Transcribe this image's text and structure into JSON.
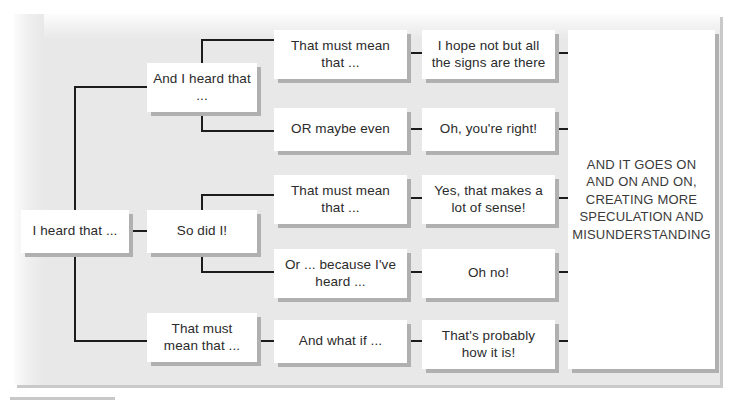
{
  "diagram": {
    "background_color": "#e8e8e8",
    "box_fill": "#ffffff",
    "box_shadow_color": "#b0b0b0",
    "line_color": "#1c1c1c",
    "text_color": "#2b2b2b",
    "nodes": [
      {
        "id": "n1",
        "label": "I heard that ...",
        "x": 21,
        "y": 210,
        "w": 108,
        "h": 43
      },
      {
        "id": "n2",
        "label": "And I heard that ...",
        "x": 147,
        "y": 63,
        "w": 110,
        "h": 49
      },
      {
        "id": "n3",
        "label": "So did I!",
        "x": 147,
        "y": 210,
        "w": 110,
        "h": 43
      },
      {
        "id": "n4",
        "label": "That must mean that ...",
        "x": 147,
        "y": 313,
        "w": 110,
        "h": 49
      },
      {
        "id": "n5",
        "label": "That must mean that ...",
        "x": 274,
        "y": 30,
        "w": 133,
        "h": 49
      },
      {
        "id": "n6",
        "label": "OR maybe even",
        "x": 274,
        "y": 108,
        "w": 133,
        "h": 43
      },
      {
        "id": "n7",
        "label": "That must mean that ...",
        "x": 274,
        "y": 175,
        "w": 133,
        "h": 49
      },
      {
        "id": "n8",
        "label": "Or ... because I've heard ...",
        "x": 274,
        "y": 249,
        "w": 133,
        "h": 49
      },
      {
        "id": "n9",
        "label": "And what if ...",
        "x": 274,
        "y": 320,
        "w": 133,
        "h": 43
      },
      {
        "id": "n10",
        "label": "I hope not but all the signs are there",
        "x": 422,
        "y": 30,
        "w": 133,
        "h": 49
      },
      {
        "id": "n11",
        "label": "Oh, you're right!",
        "x": 422,
        "y": 108,
        "w": 133,
        "h": 43
      },
      {
        "id": "n12",
        "label": "Yes, that makes a lot of sense!",
        "x": 422,
        "y": 175,
        "w": 133,
        "h": 49
      },
      {
        "id": "n13",
        "label": "Oh no!",
        "x": 422,
        "y": 249,
        "w": 133,
        "h": 49
      },
      {
        "id": "n14",
        "label": "That's probably how it is!",
        "x": 422,
        "y": 320,
        "w": 133,
        "h": 49
      },
      {
        "id": "n15",
        "label": "AND IT GOES ON AND ON AND ON, CREATING MORE SPECULATION AND MISUNDERSTANDING",
        "x": 568,
        "y": 30,
        "w": 147,
        "h": 339
      }
    ]
  }
}
